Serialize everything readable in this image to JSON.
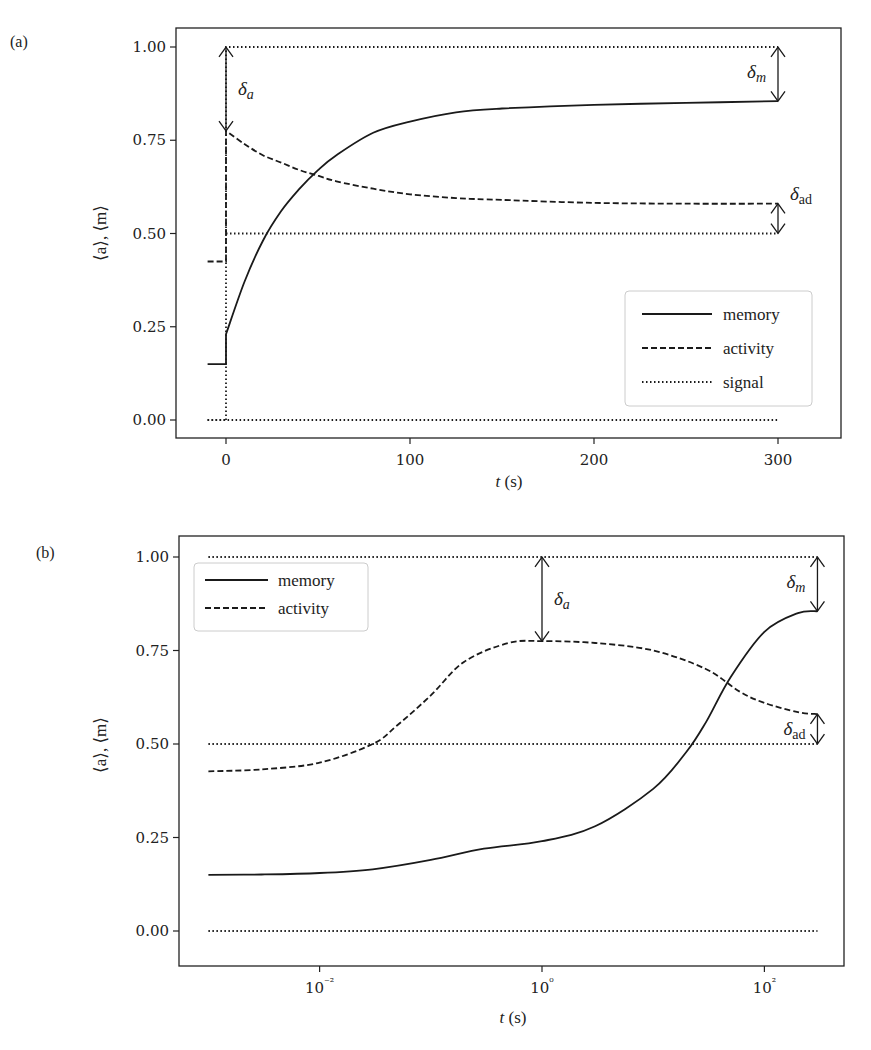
{
  "chart_data": [
    {
      "panel": "(a)",
      "type": "line",
      "xlabel": "t (s)",
      "ylabel": "⟨a⟩, ⟨m⟩",
      "xscale": "linear",
      "xlim": [
        -27,
        320
      ],
      "ylim": [
        -0.05,
        1.05
      ],
      "xticks": [
        0,
        100,
        200,
        300
      ],
      "xtick_labels": [
        "0",
        "100",
        "200",
        "300"
      ],
      "yticks": [
        0.0,
        0.25,
        0.5,
        0.75,
        1.0
      ],
      "ytick_labels": [
        "0.00",
        "0.25",
        "0.50",
        "0.75",
        "1.00"
      ],
      "grid": false,
      "legend": {
        "position": "lower right",
        "entries": [
          "memory",
          "activity",
          "signal"
        ]
      },
      "series": [
        {
          "name": "memory",
          "style": "solid",
          "x": [
            -10,
            0,
            0,
            10,
            20,
            30,
            40,
            50,
            60,
            80,
            100,
            125,
            150,
            200,
            250,
            300
          ],
          "values": [
            0.15,
            0.15,
            0.23,
            0.37,
            0.48,
            0.56,
            0.62,
            0.67,
            0.71,
            0.77,
            0.8,
            0.825,
            0.835,
            0.845,
            0.85,
            0.855
          ]
        },
        {
          "name": "activity",
          "style": "dashed",
          "x": [
            -10,
            0,
            0,
            10,
            20,
            30,
            40,
            50,
            60,
            80,
            100,
            125,
            150,
            200,
            250,
            300
          ],
          "values": [
            0.425,
            0.425,
            0.775,
            0.74,
            0.71,
            0.69,
            0.67,
            0.655,
            0.64,
            0.62,
            0.605,
            0.595,
            0.59,
            0.582,
            0.58,
            0.58
          ]
        },
        {
          "name": "signal (baseline)",
          "style": "dotted",
          "x": [
            -10,
            0
          ],
          "values": [
            0.0,
            0.0
          ]
        },
        {
          "name": "signal",
          "style": "dotted",
          "x": [
            0,
            0,
            300
          ],
          "values": [
            0.0,
            1.0,
            1.0
          ]
        },
        {
          "name": "reference 0.5",
          "style": "dotted",
          "x": [
            0,
            300
          ],
          "values": [
            0.5,
            0.5
          ]
        },
        {
          "name": "reference 0.0",
          "style": "dotted",
          "x": [
            -10,
            300
          ],
          "values": [
            0.0,
            0.0
          ]
        }
      ],
      "annotations": [
        {
          "label": "δa",
          "main": "δ",
          "sub": "a",
          "x": 0,
          "from": 1.0,
          "to": 0.775,
          "description": "gap between signal and peak activity"
        },
        {
          "label": "δm",
          "main": "δ",
          "sub": "m",
          "x": 300,
          "from": 1.0,
          "to": 0.855,
          "description": "gap between signal and steady memory"
        },
        {
          "label": "δad",
          "main": "δ",
          "sub": "ad",
          "x": 300,
          "from": 0.58,
          "to": 0.5,
          "description": "gap between steady activity and 0.5"
        }
      ]
    },
    {
      "panel": "(b)",
      "type": "line",
      "xlabel": "t (s)",
      "ylabel": "⟨a⟩, ⟨m⟩",
      "xscale": "log",
      "xlim": [
        0.0003,
        800
      ],
      "ylim": [
        -0.05,
        1.05
      ],
      "xticks": [
        0.01,
        1,
        100
      ],
      "xtick_labels": [
        "10⁻²",
        "10⁰",
        "10²"
      ],
      "yticks": [
        0.0,
        0.25,
        0.5,
        0.75,
        1.0
      ],
      "ytick_labels": [
        "0.00",
        "0.25",
        "0.50",
        "0.75",
        "1.00"
      ],
      "grid": false,
      "legend": {
        "position": "upper left",
        "entries": [
          "memory",
          "activity"
        ]
      },
      "series": [
        {
          "name": "memory",
          "style": "solid",
          "x": [
            0.001,
            0.003,
            0.01,
            0.03,
            0.1,
            0.3,
            1,
            3,
            10,
            20,
            30,
            50,
            100,
            200,
            300
          ],
          "values": [
            0.15,
            0.151,
            0.155,
            0.165,
            0.19,
            0.22,
            0.24,
            0.28,
            0.38,
            0.48,
            0.56,
            0.68,
            0.8,
            0.85,
            0.855
          ]
        },
        {
          "name": "activity",
          "style": "dashed",
          "x": [
            0.001,
            0.003,
            0.01,
            0.03,
            0.05,
            0.1,
            0.2,
            0.5,
            1,
            3,
            10,
            30,
            60,
            100,
            200,
            300
          ],
          "values": [
            0.427,
            0.432,
            0.45,
            0.5,
            0.55,
            0.63,
            0.72,
            0.77,
            0.775,
            0.77,
            0.75,
            0.7,
            0.64,
            0.61,
            0.585,
            0.58
          ]
        },
        {
          "name": "signal",
          "style": "dotted",
          "x": [
            0.001,
            300
          ],
          "values": [
            1.0,
            1.0
          ]
        },
        {
          "name": "reference 0.5",
          "style": "dotted",
          "x": [
            0.001,
            300
          ],
          "values": [
            0.5,
            0.5
          ]
        },
        {
          "name": "reference 0.0",
          "style": "dotted",
          "x": [
            0.001,
            300
          ],
          "values": [
            0.0,
            0.0
          ]
        }
      ],
      "annotations": [
        {
          "label": "δa",
          "main": "δ",
          "sub": "a",
          "x": 1,
          "from": 1.0,
          "to": 0.775
        },
        {
          "label": "δm",
          "main": "δ",
          "sub": "m",
          "x": 300,
          "from": 1.0,
          "to": 0.855
        },
        {
          "label": "δad",
          "main": "δ",
          "sub": "ad",
          "x": 300,
          "from": 0.58,
          "to": 0.5
        }
      ]
    }
  ],
  "panels": {
    "a": {
      "label": "(a)",
      "xlabel_main": "t",
      "xlabel_unit": " (s)",
      "ylabel": "⟨a⟩, ⟨m⟩",
      "legend": {
        "memory": "memory",
        "activity": "activity",
        "signal": "signal"
      }
    },
    "b": {
      "label": "(b)",
      "xlabel_main": "t",
      "xlabel_unit": " (s)",
      "ylabel": "⟨a⟩, ⟨m⟩",
      "legend": {
        "memory": "memory",
        "activity": "activity"
      }
    }
  },
  "colors": {
    "line": "#1a1a1a",
    "frame": "#222222",
    "legend_border": "#cccccc",
    "background": "#ffffff"
  }
}
